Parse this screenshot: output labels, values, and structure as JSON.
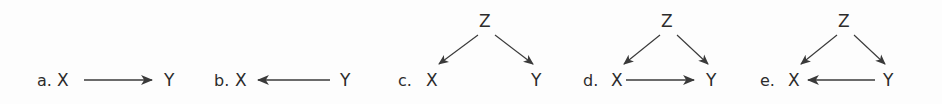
{
  "figure": {
    "caption": "",
    "background_color": "#fdfdfd",
    "ink_color": "#2c2c2c",
    "edge_color": "#3a3a3a"
  },
  "panels": [
    {
      "id": "a",
      "label": "a.",
      "nodes": {
        "x": "X",
        "y": "Y",
        "z": null
      },
      "edges": [
        "X->Y"
      ]
    },
    {
      "id": "b",
      "label": "b.",
      "nodes": {
        "x": "X",
        "y": "Y",
        "z": null
      },
      "edges": [
        "Y->X"
      ]
    },
    {
      "id": "c",
      "label": "c.",
      "nodes": {
        "x": "X",
        "y": "Y",
        "z": "Z"
      },
      "edges": [
        "Z->X",
        "Z->Y"
      ]
    },
    {
      "id": "d",
      "label": "d.",
      "nodes": {
        "x": "X",
        "y": "Y",
        "z": "Z"
      },
      "edges": [
        "Z->X",
        "Z->Y",
        "X->Y"
      ]
    },
    {
      "id": "e",
      "label": "e.",
      "nodes": {
        "x": "X",
        "y": "Y",
        "z": "Z"
      },
      "edges": [
        "Z->X",
        "Z->Y",
        "Y->X"
      ]
    }
  ]
}
